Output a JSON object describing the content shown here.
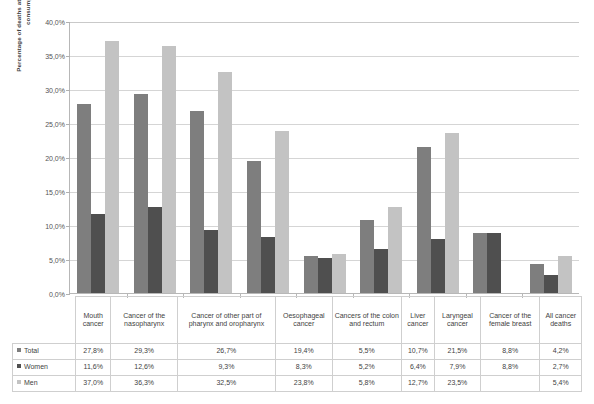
{
  "chart_data": {
    "type": "bar",
    "title": "",
    "xlabel": "",
    "ylabel": "Percentage of deaths attributable to alcohol consumption",
    "ylim": [
      0,
      40
    ],
    "ytick_labels": [
      "40,0%",
      "35,0%",
      "30,0%",
      "25,0%",
      "20,0%",
      "15,0%",
      "10,0%",
      "5,0%",
      "0,0%"
    ],
    "ytick_values": [
      40,
      35,
      30,
      25,
      20,
      15,
      10,
      5,
      0
    ],
    "grid": true,
    "legend_position": "table-left",
    "categories": [
      "Mouth cancer",
      "Cancer of the nasopharynx",
      "Cancer of other part of pharynx and oropharynx",
      "Oesophageal cancer",
      "Cancers of the colon and rectum",
      "Liver cancer",
      "Laryngeal cancer",
      "Cancer of the female breast",
      "All cancer deaths"
    ],
    "series": [
      {
        "name": "Total",
        "color": "#7e7e7e",
        "values": [
          27.8,
          29.3,
          26.7,
          19.4,
          5.5,
          10.7,
          21.5,
          8.8,
          4.2
        ],
        "labels": [
          "27,8%",
          "29,3%",
          "26,7%",
          "19,4%",
          "5,5%",
          "10,7%",
          "21,5%",
          "8,8%",
          "4,2%"
        ]
      },
      {
        "name": "Women",
        "color": "#4f4f4f",
        "values": [
          11.6,
          12.6,
          9.3,
          8.3,
          5.2,
          6.4,
          7.9,
          8.8,
          2.7
        ],
        "labels": [
          "11,6%",
          "12,6%",
          "9,3%",
          "8,3%",
          "5,2%",
          "6,4%",
          "7,9%",
          "8,8%",
          "2,7%"
        ]
      },
      {
        "name": "Men",
        "color": "#c3c3c3",
        "values": [
          37.0,
          36.3,
          32.5,
          23.8,
          5.8,
          12.7,
          23.5,
          null,
          5.4
        ],
        "labels": [
          "37,0%",
          "36,3%",
          "32,5%",
          "23,8%",
          "5,8%",
          "12,7%",
          "23,5%",
          "",
          "5,4%"
        ]
      }
    ]
  },
  "table": {
    "row_labels": [
      "Total",
      "Women",
      "Men"
    ]
  }
}
